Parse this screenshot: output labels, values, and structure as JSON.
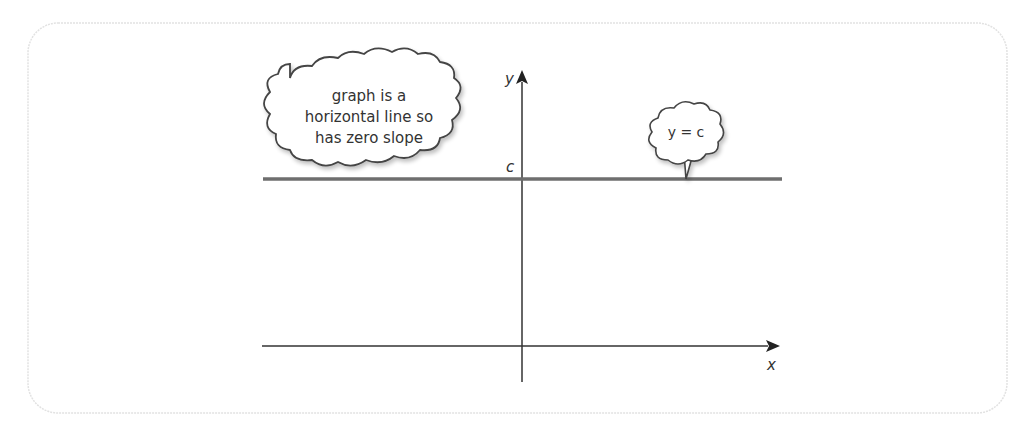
{
  "diagram": {
    "type": "graph-of-horizontal-line",
    "axes": {
      "x_label": "x",
      "y_label": "y",
      "y_intercept_label": "c"
    },
    "line": {
      "equation_label": "y = c",
      "color": "#6e6e6e"
    },
    "callout": {
      "lines": [
        "graph is a",
        "horizontal line so",
        "has zero slope"
      ]
    },
    "colors": {
      "frame_border": "#e2e2e2",
      "axis": "#333333",
      "cloud_stroke": "#444444"
    }
  }
}
